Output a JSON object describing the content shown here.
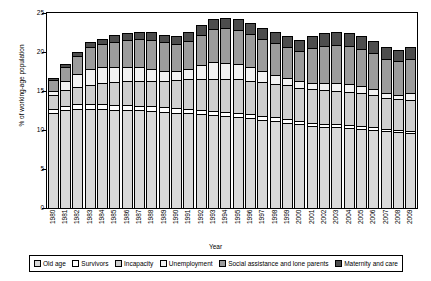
{
  "chart_data": {
    "type": "bar",
    "stacked": true,
    "title": "",
    "xlabel": "Year",
    "ylabel": "% of working-age population",
    "ylim": [
      0,
      25
    ],
    "yticks": [
      0,
      5,
      10,
      15,
      20,
      25
    ],
    "grid": false,
    "legend_position": "bottom",
    "categories": [
      "1980",
      "1981",
      "1982",
      "1983",
      "1984",
      "1985",
      "1986",
      "1987",
      "1988",
      "1989",
      "1990",
      "1991",
      "1992",
      "1993",
      "1994",
      "1995",
      "1996",
      "1997",
      "1998",
      "1999",
      "2000",
      "2001",
      "2002",
      "2003",
      "2004",
      "2005",
      "2006",
      "2007",
      "2008",
      "2009"
    ],
    "series": [
      {
        "name": "Old age",
        "values": [
          12.0,
          12.4,
          12.6,
          12.6,
          12.6,
          12.5,
          12.5,
          12.4,
          12.3,
          12.2,
          12.1,
          12.0,
          11.9,
          11.8,
          11.7,
          11.6,
          11.4,
          11.2,
          11.0,
          10.8,
          10.6,
          10.4,
          10.3,
          10.2,
          10.1,
          10.0,
          9.9,
          9.7,
          9.6,
          9.5
        ]
      },
      {
        "name": "Survivors",
        "values": [
          0.6,
          0.6,
          0.6,
          0.6,
          0.6,
          0.6,
          0.6,
          0.6,
          0.6,
          0.6,
          0.6,
          0.6,
          0.5,
          0.5,
          0.5,
          0.5,
          0.5,
          0.5,
          0.5,
          0.5,
          0.4,
          0.4,
          0.4,
          0.4,
          0.4,
          0.4,
          0.4,
          0.3,
          0.3,
          0.3
        ]
      },
      {
        "name": "Incapacity",
        "values": [
          1.8,
          2.0,
          2.2,
          2.5,
          2.7,
          2.9,
          3.0,
          3.1,
          3.2,
          3.4,
          3.6,
          3.8,
          4.0,
          4.1,
          4.2,
          4.3,
          4.3,
          4.3,
          4.3,
          4.3,
          4.3,
          4.3,
          4.3,
          4.3,
          4.3,
          4.2,
          4.1,
          4.0,
          3.9,
          3.9
        ]
      },
      {
        "name": "Unemployment",
        "values": [
          0.5,
          1.1,
          1.7,
          2.0,
          2.0,
          2.0,
          1.9,
          1.8,
          1.6,
          1.3,
          1.1,
          1.3,
          1.8,
          2.2,
          2.1,
          1.9,
          1.7,
          1.4,
          1.1,
          0.9,
          0.8,
          0.8,
          0.9,
          1.0,
          1.0,
          0.9,
          0.7,
          0.6,
          0.6,
          0.9
        ]
      },
      {
        "name": "Social assistance and lone parents",
        "values": [
          1.4,
          1.8,
          2.3,
          2.8,
          3.0,
          3.2,
          3.4,
          3.6,
          3.7,
          3.6,
          3.5,
          3.6,
          3.9,
          4.2,
          4.4,
          4.4,
          4.3,
          4.2,
          4.1,
          4.0,
          3.9,
          4.5,
          4.8,
          4.9,
          4.9,
          4.8,
          4.6,
          4.4,
          4.3,
          4.4
        ]
      },
      {
        "name": "Maternity and care",
        "values": [
          0.3,
          0.4,
          0.5,
          0.6,
          0.7,
          0.8,
          0.9,
          0.9,
          1.0,
          1.0,
          1.0,
          1.1,
          1.2,
          1.3,
          1.4,
          1.4,
          1.4,
          1.4,
          1.4,
          1.4,
          1.4,
          1.5,
          1.6,
          1.6,
          1.6,
          1.6,
          1.6,
          1.5,
          1.5,
          1.5
        ]
      }
    ],
    "totals": [
      16.6,
      18.3,
      19.9,
      21.1,
      21.6,
      22.0,
      22.3,
      22.4,
      22.4,
      22.1,
      21.9,
      22.4,
      23.3,
      24.1,
      24.3,
      24.1,
      23.6,
      23.0,
      22.4,
      21.9,
      21.4,
      21.9,
      22.3,
      22.4,
      22.3,
      21.9,
      21.3,
      20.5,
      20.2,
      20.5
    ]
  },
  "axis": {
    "y_title": "% of working-age population",
    "x_title": "Year"
  },
  "colors": {
    "old_age": "#d9d9d9",
    "survivors": "#ffffff",
    "incapacity": "#cfcfcf",
    "unemployment": "#f2f2f2",
    "social_assistance": "#9c9c9c",
    "maternity": "#4d4d4d",
    "axis": "#000000"
  }
}
